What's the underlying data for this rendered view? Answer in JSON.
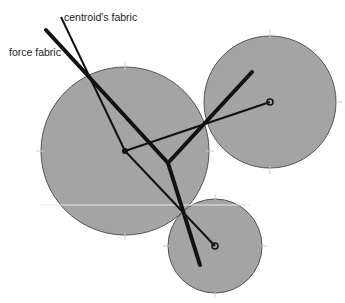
{
  "labels": {
    "centroid_fabric": "centroid's fabric",
    "force_fabric": "force fabric"
  },
  "colors": {
    "disc_fill": "#a4a4a4",
    "disc_stroke": "#555555",
    "line": "#111111",
    "background": "#ffffff"
  },
  "discs": [
    {
      "name": "large-left",
      "cx": 125,
      "cy": 151,
      "r": 84
    },
    {
      "name": "upper-right",
      "cx": 270,
      "cy": 102,
      "r": 66
    },
    {
      "name": "lower",
      "cx": 215,
      "cy": 246,
      "r": 47
    }
  ]
}
